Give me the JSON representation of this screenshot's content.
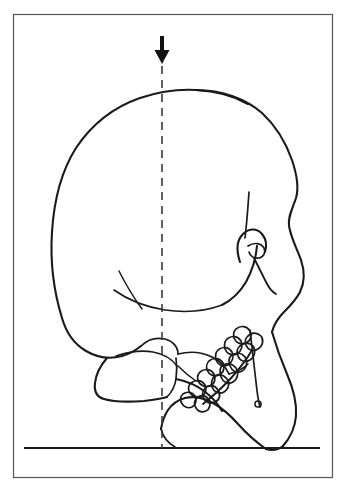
{
  "figure": {
    "title": "Inverted lateral skull tracing with vertical reference plumb line",
    "domain_kind": "line-drawing",
    "background_color": "#ffffff",
    "ink_color": "#1a1a1a",
    "frame": {
      "name": "figure-border",
      "x": 13,
      "y": 14,
      "width": 320,
      "height": 464,
      "stroke_color": "#555555",
      "stroke_width": 1.2
    },
    "baseline": {
      "name": "horizontal-baseline",
      "x1": 24,
      "y1": 448,
      "x2": 320,
      "y2": 448,
      "stroke_color": "#1a1a1a",
      "stroke_width": 2.2,
      "label": ""
    },
    "reference_line": {
      "name": "vertical-dashed-reference-line",
      "x": 162,
      "y_top": 66,
      "y_bottom": 448,
      "stroke_color": "#3a3a3a",
      "stroke_width": 1.6,
      "dash_length": 8,
      "gap_length": 6
    },
    "arrow_marker": {
      "name": "down-arrow-marker",
      "tip_x": 162,
      "tip_y": 64,
      "stem_top_y": 36,
      "stem_width": 4,
      "head_width": 15,
      "head_height": 14,
      "fill_color": "#111111",
      "direction": "down",
      "label": ""
    },
    "anatomy": {
      "orientation": "inverted",
      "view": "lateral",
      "subject": "human skull",
      "parts": [
        "cranial vault",
        "frontal bone",
        "occipital bone",
        "zygomatic arch",
        "mastoid process",
        "external acoustic meatus",
        "orbital rim",
        "nasal aperture",
        "maxilla",
        "mandible",
        "mandibular ramus",
        "mandibular angle",
        "mental foramen",
        "maxillary tooth row",
        "mandibular tooth row"
      ]
    },
    "tooth_counts": {
      "maxillary_row": 7,
      "mandibular_row": 7
    }
  }
}
